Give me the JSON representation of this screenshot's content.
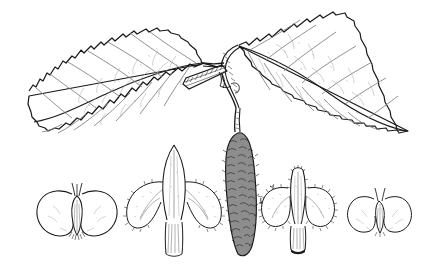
{
  "plate": {
    "kind": "botanical-line-illustration",
    "subject": "birch (Betula) branch with leaves, catkin, bracts and winged nutlets",
    "technique": "pen-and-ink stipple and hatch line drawing",
    "background_color": "#ffffff",
    "ink_color": "#1a1a1a",
    "width_px": 425,
    "height_px": 276,
    "has_text_labels": false,
    "caption": ""
  },
  "palette": {
    "ink_dark": "#1a1a1a",
    "ink_medium": "#3a3a3a",
    "ink_light": "#7d7d7d",
    "ink_very_light": "#a8a8a8",
    "paper": "#ffffff",
    "bark_fill": "#cfcfcf",
    "catkin_fill": "#8d8d8d"
  },
  "figures": [
    {
      "id": "left-leaf",
      "name": "left leaf",
      "description": "triangular-ovate leaf with doubly serrate margin and pinnate venation, angled down-left",
      "margin": "doubly serrate",
      "venation": "pinnate",
      "vein_pairs": 7,
      "apex": "acute",
      "base": "truncate-cuneate"
    },
    {
      "id": "right-leaf",
      "name": "right leaf",
      "description": "triangular-ovate leaf with doubly serrate margin, angled up-right, acuminate tip",
      "margin": "doubly serrate",
      "venation": "pinnate",
      "vein_pairs": 7,
      "apex": "acuminate",
      "base": "truncate"
    },
    {
      "id": "twig",
      "name": "twig with stub branch",
      "description": "dark cross-hatched woody twig bearing a short horizontal lateral stub and two petioles",
      "texture": "cross-hatched bark"
    },
    {
      "id": "catkin",
      "name": "pendulous catkin (strobile)",
      "description": "elongated cylindrical fruiting catkin on a curved peduncle, densely covered in overlapping scales",
      "orientation": "pendulous",
      "scale_texture": "imbricate scales with bristle tips"
    },
    {
      "id": "nutlet-left",
      "name": "winged nutlet, left",
      "description": "samara with two broad rounded lateral wings, central ovate seed body and two erect styles",
      "wings": 2,
      "styles": 2
    },
    {
      "id": "bract-center-left",
      "name": "fruiting bract, three-lobed",
      "description": "three-lobed fruiting scale with erect lanceolate central lobe and two spreading recurved lateral lobes, ciliate margin",
      "lobes": 3
    },
    {
      "id": "bract-center-right",
      "name": "fruiting bract, hairy variant",
      "description": "three-lobed fruiting scale with short blunt central lobe and broad rounded hairy lateral lobes on a dark stalk",
      "lobes": 3
    },
    {
      "id": "nutlet-right",
      "name": "winged nutlet, right",
      "description": "smaller samara with two squared lateral wings, central seed body and two erect styles",
      "wings": 2,
      "styles": 2
    }
  ]
}
